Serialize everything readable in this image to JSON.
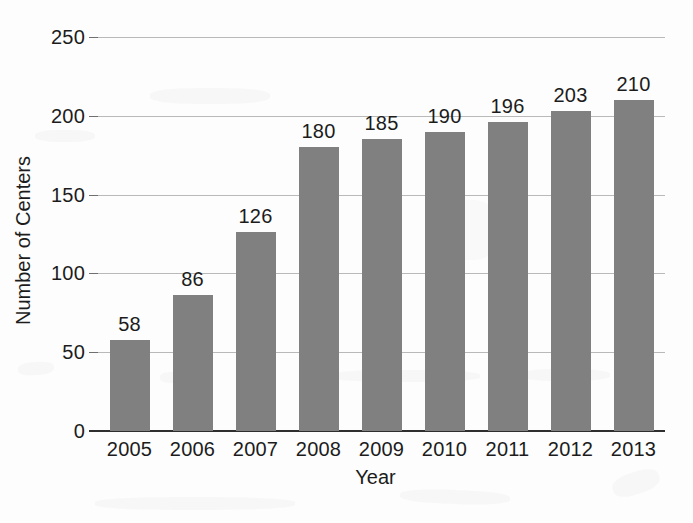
{
  "chart_data": {
    "type": "bar",
    "title": "",
    "subtitle": "",
    "xlabel": "Year",
    "ylabel": "Number of Centers",
    "categories": [
      "2005",
      "2006",
      "2007",
      "2008",
      "2009",
      "2010",
      "2011",
      "2012",
      "2013"
    ],
    "values": [
      58,
      86,
      126,
      180,
      185,
      190,
      196,
      203,
      210
    ],
    "data_labels": [
      "58",
      "86",
      "126",
      "180",
      "185",
      "190",
      "196",
      "203",
      "210"
    ],
    "ylim": [
      0,
      250
    ],
    "ytick_values": [
      0,
      50,
      100,
      150,
      200,
      250
    ],
    "ytick_labels": [
      "0",
      "50",
      "100",
      "150",
      "200",
      "250"
    ],
    "grid": true,
    "grid_axis": "y",
    "legend": false,
    "legend_position": "none",
    "bar_color": "#808080",
    "grid_color": "#b9b9b9",
    "axis_color": "#2e2e2e",
    "text_color": "#1c1c1c",
    "background_color": "#fdfdfd"
  }
}
